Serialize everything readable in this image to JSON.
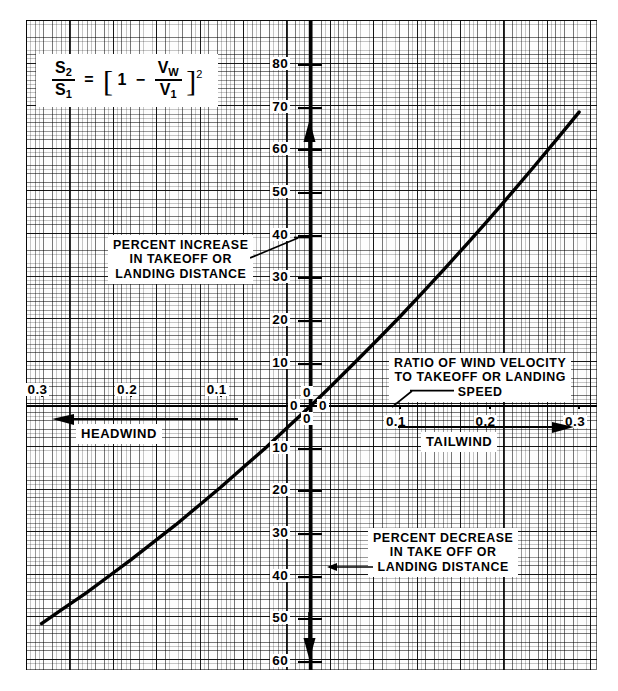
{
  "chart_data": {
    "type": "line",
    "formula": {
      "lhs_num": "S",
      "lhs_num_sub": "2",
      "lhs_den": "S",
      "lhs_den_sub": "1",
      "equals": "=",
      "bracket_open": "[",
      "bracket_close": "]",
      "one": "1",
      "minus": "−",
      "rhs_num": "V",
      "rhs_num_sub": "W",
      "rhs_den": "V",
      "rhs_den_sub": "1",
      "exponent": "2",
      "plain": "S2/S1 = [1 - VW/V1]^2"
    },
    "xlabel": "RATIO OF WIND VELOCITY TO TAKEOFF OR LANDING SPEED",
    "ylabel_positive": "PERCENT INCREASE IN TAKEOFF OR LANDING DISTANCE",
    "ylabel_negative": "PERCENT DECREASE IN TAKE OFF OR LANDING DISTANCE",
    "xlim": [
      -0.33,
      0.33
    ],
    "ylim": [
      -63,
      86
    ],
    "grid": true,
    "legend": "none",
    "x_ticks_left": [
      "0.3",
      "0.2",
      "0.1"
    ],
    "x_tick_origin": "0",
    "x_ticks_right": [
      "0.1",
      "0.2",
      "0.3"
    ],
    "y_ticks_upper": [
      "80",
      "70",
      "60",
      "50",
      "40",
      "30",
      "20",
      "10"
    ],
    "y_tick_origin_upper": "0",
    "y_tick_origin_lower": "0",
    "y_ticks_lower": [
      "10",
      "20",
      "30",
      "40",
      "50",
      "60"
    ],
    "origin_labels": [
      "0",
      "0",
      "0",
      "0"
    ],
    "series": [
      {
        "name": "percent change in distance",
        "x": [
          -0.3,
          -0.275,
          -0.25,
          -0.225,
          -0.2,
          -0.175,
          -0.15,
          -0.125,
          -0.1,
          -0.075,
          -0.05,
          -0.025,
          0.0,
          0.025,
          0.05,
          0.075,
          0.1,
          0.125,
          0.15,
          0.175,
          0.2,
          0.225,
          0.25,
          0.275,
          0.3
        ],
        "y": [
          -51.0,
          -47.4,
          -43.8,
          -39.9,
          -36.0,
          -31.9,
          -27.8,
          -23.4,
          -19.0,
          -14.4,
          -9.8,
          -4.9,
          0.0,
          5.1,
          10.3,
          15.6,
          21.0,
          26.6,
          32.3,
          38.1,
          44.0,
          50.1,
          56.3,
          62.6,
          69.0
        ]
      }
    ]
  },
  "axes": {
    "headwind_label": "HEADWIND",
    "tailwind_label": "TAILWIND",
    "headwind_arrow": "left-arrow-icon",
    "tailwind_arrow": "right-arrow-icon",
    "up_arrow": "up-arrow-icon",
    "down_arrow": "down-arrow-icon"
  },
  "callouts": {
    "increase": [
      "PERCENT INCREASE",
      "IN TAKEOFF OR",
      "LANDING DISTANCE"
    ],
    "decrease": [
      "PERCENT DECREASE",
      "IN TAKE OFF OR",
      "LANDING DISTANCE"
    ],
    "ratio": [
      "RATIO OF WIND VELOCITY",
      "TO TAKEOFF OR LANDING",
      "SPEED"
    ]
  },
  "colors": {
    "ink": "#000000",
    "paper": "#fdfdfd",
    "grid_major": "rgba(0,0,0,.82)",
    "grid_minor": "rgba(0,0,0,.22)"
  }
}
